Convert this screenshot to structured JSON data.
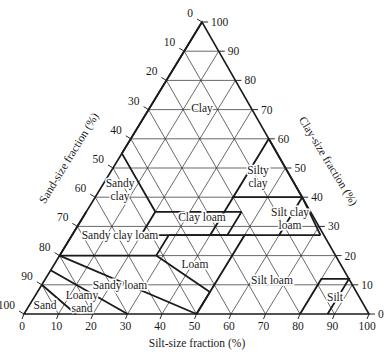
{
  "geometry": {
    "top": [
      202,
      22
    ],
    "bottom_left": [
      24,
      314
    ],
    "bottom_right": [
      369,
      314
    ]
  },
  "colors": {
    "line": "#1a1a1a",
    "grid": "#2a2a2a",
    "background": "#ffffff"
  },
  "axes": {
    "sand": {
      "title": "Sand-size fraction (%)",
      "ticks": [
        "0",
        "10",
        "20",
        "30",
        "40",
        "50",
        "60",
        "70",
        "80",
        "90",
        "100"
      ]
    },
    "clay": {
      "title": "Clay-size fraction (%)",
      "ticks": [
        "0",
        "10",
        "20",
        "30",
        "40",
        "50",
        "60",
        "70",
        "80",
        "90",
        "100"
      ]
    },
    "silt": {
      "title": "Silt-size fraction (%)",
      "ticks": [
        "0",
        "10",
        "20",
        "30",
        "40",
        "50",
        "60",
        "70",
        "80",
        "90",
        "100"
      ]
    }
  },
  "regions": [
    {
      "name": "Clay",
      "lines": [
        "Clay"
      ],
      "at": [
        202,
        108
      ]
    },
    {
      "name": "Silty clay",
      "lines": [
        "Silty",
        "clay"
      ],
      "at": [
        258,
        176
      ]
    },
    {
      "name": "Sandy clay",
      "lines": [
        "Sandy",
        "clay"
      ],
      "at": [
        120,
        189
      ]
    },
    {
      "name": "Clay loam",
      "lines": [
        "Clay loam"
      ],
      "at": [
        202,
        217
      ]
    },
    {
      "name": "Silt clay loam",
      "lines": [
        "Silt clay",
        "loam"
      ],
      "at": [
        290,
        218
      ]
    },
    {
      "name": "Sandy clay loam",
      "lines": [
        "Sandy clay loam"
      ],
      "at": [
        120,
        235
      ]
    },
    {
      "name": "Loam",
      "lines": [
        "Loam"
      ],
      "at": [
        195,
        264
      ]
    },
    {
      "name": "Silt loam",
      "lines": [
        "Silt loam"
      ],
      "at": [
        272,
        280
      ]
    },
    {
      "name": "Sandy loam",
      "lines": [
        "Sandy loam"
      ],
      "at": [
        120,
        285
      ]
    },
    {
      "name": "Silt",
      "lines": [
        "Silt"
      ],
      "at": [
        335,
        297
      ]
    },
    {
      "name": "Sand",
      "lines": [
        "Sand"
      ],
      "at": [
        45,
        305
      ]
    },
    {
      "name": "Loamy sand",
      "lines": [
        "Loamy",
        "sand"
      ],
      "at": [
        82,
        301
      ]
    }
  ],
  "boundaries": [
    [
      [
        40,
        0
      ],
      [
        40,
        15
      ],
      [
        55,
        0
      ],
      [
        40,
        45
      ],
      [
        60,
        40
      ],
      [
        100,
        0
      ]
    ],
    [
      [
        40,
        15
      ],
      [
        28,
        43
      ],
      [
        28,
        72
      ],
      [
        40,
        45
      ]
    ],
    [
      [
        35,
        0
      ],
      [
        35,
        20
      ],
      [
        28,
        35
      ]
    ],
    [
      [
        20,
        0
      ],
      [
        20,
        45
      ],
      [
        27,
        45
      ],
      [
        27,
        52
      ],
      [
        7,
        73
      ],
      [
        0,
        80
      ]
    ],
    [
      [
        27,
        52
      ],
      [
        27,
        28
      ],
      [
        12,
        40
      ]
    ],
    [
      [
        12,
        40
      ],
      [
        12,
        80
      ],
      [
        0,
        88
      ]
    ],
    [
      [
        12,
        88
      ],
      [
        0,
        88
      ]
    ],
    [
      [
        12,
        80
      ],
      [
        12,
        88
      ],
      [
        0,
        100
      ]
    ],
    [
      [
        0,
        70
      ],
      [
        15,
        85
      ],
      [
        10,
        85
      ],
      [
        0,
        90
      ]
    ],
    [
      [
        20,
        45
      ],
      [
        20,
        80
      ],
      [
        10,
        80
      ]
    ]
  ]
}
